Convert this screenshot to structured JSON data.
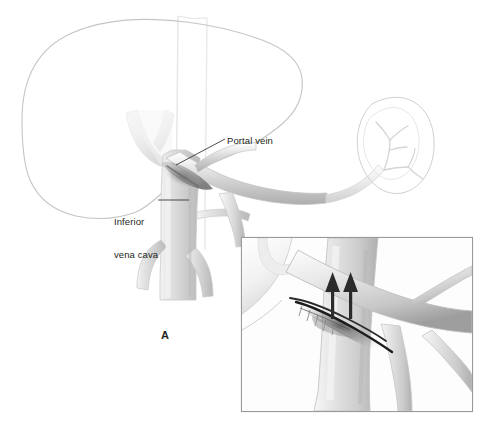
{
  "figure": {
    "panel_letter": "A",
    "background_color": "#ffffff",
    "width": 490,
    "height": 447
  },
  "labels": {
    "portal_vein": "Portal vein",
    "inferior_vena_cava_line1": "Inferior",
    "inferior_vena_cava_line2": "vena cava"
  },
  "colors": {
    "outline": "#bdbdbd",
    "liver_outline": "#c8c8c8",
    "vessel_light": "#e8e8e8",
    "vessel_mid": "#c4c4c4",
    "vessel_dark": "#8a8a8a",
    "shadow": "#6f6f6f",
    "text": "#231f20",
    "arrow": "#2b2b2b",
    "inset_border": "#9a9a9a",
    "spine_line": "#e2e2e2"
  },
  "structures": [
    {
      "name": "liver",
      "type": "outline",
      "description": "large liver silhouette occupying upper-left"
    },
    {
      "name": "spleen",
      "type": "outline",
      "description": "kidney-shaped spleen at upper right with hilar vessels"
    },
    {
      "name": "portal-vein",
      "type": "vessel",
      "description": "portal vein running from splenic/mesenteric confluence to liver hilum"
    },
    {
      "name": "inferior-vena-cava",
      "type": "vessel",
      "description": "vertical inferior vena cava with iliac bifurcation"
    },
    {
      "name": "hepatic-veins",
      "type": "vessel",
      "description": "pale V-shaped hepatic vein confluence within liver"
    },
    {
      "name": "splenic-vein",
      "type": "vessel",
      "description": "splenic vein with branching tributaries toward spleen"
    },
    {
      "name": "spine-guides",
      "type": "guide",
      "description": "two faint vertical vertebral column lines"
    }
  ],
  "inset": {
    "name": "magnified-anastomosis",
    "border_color": "#9a9a9a",
    "x": 241,
    "y": 237,
    "width": 232,
    "height": 175,
    "arrow_count": 2,
    "arrow_direction": "up",
    "description": "magnified view of side-to-side portocaval anastomosis with upward blood-flow arrows"
  },
  "leader_lines": [
    {
      "name": "portal-vein-leader",
      "from": [
        225,
        139
      ],
      "to": [
        175,
        164
      ]
    },
    {
      "name": "ivc-leader",
      "from": [
        157,
        200
      ],
      "to": [
        188,
        200
      ]
    }
  ]
}
